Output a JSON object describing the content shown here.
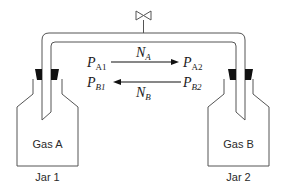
{
  "diagram": {
    "valve": {
      "icon": "valve-icon"
    },
    "jars": [
      {
        "gas_label": "Gas A",
        "jar_label": "Jar 1"
      },
      {
        "gas_label": "Gas B",
        "jar_label": "Jar 2"
      }
    ],
    "flux_labels": {
      "top_left": {
        "base": "P",
        "sub": "A1"
      },
      "top_right": {
        "base": "P",
        "sub": "A2"
      },
      "bottom_left": {
        "base": "P",
        "sub": "B1"
      },
      "bottom_right": {
        "base": "P",
        "sub": "B2"
      },
      "flux_a": {
        "base": "N",
        "sub": "A"
      },
      "flux_b": {
        "base": "N",
        "sub": "B"
      }
    },
    "colors": {
      "line": "#555555",
      "stopper": "#111111",
      "text": "#1a1a1a"
    }
  }
}
